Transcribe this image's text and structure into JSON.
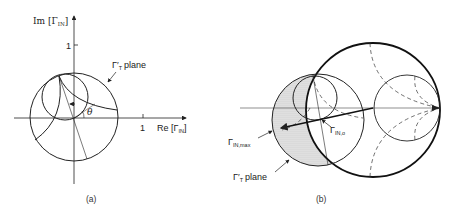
{
  "panel_a": {
    "caption": "(a)",
    "y_axis_label": "Im [Γ",
    "y_axis_sub": "IN",
    "y_axis_close": "]",
    "x_axis_label": "Re [Γ",
    "x_axis_sub": "IN",
    "x_axis_close": "]",
    "y_tick": "1",
    "x_tick": "1",
    "plane_label": "Γ′",
    "plane_sub": "T",
    "plane_text": "plane",
    "angle_label": "θ"
  },
  "panel_b": {
    "caption": "(b)",
    "gamma_in_max": "Γ",
    "gamma_in_max_sub": "IN,max",
    "gamma_in_o": "Γ",
    "gamma_in_o_sub": "IN,o",
    "plane_label": "Γ′",
    "plane_sub": "T",
    "plane_text": "plane"
  },
  "colors": {
    "line": "#222222",
    "shade": "#d9d9d9"
  }
}
